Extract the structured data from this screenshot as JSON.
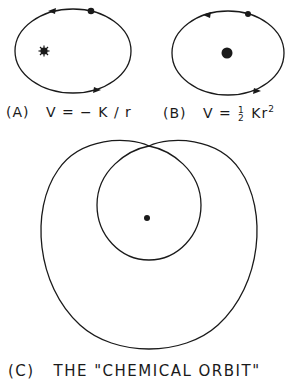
{
  "panels": {
    "a": {
      "tag": "(A)",
      "formula": "V = − K / r",
      "formula_prefix": "V = − K / r",
      "description": "Elliptical orbit in Coulomb (1/r) potential with force center at focus"
    },
    "b": {
      "tag": "(B)",
      "formula_prefix": "V =",
      "fraction_numerator": "1",
      "fraction_denominator": "2",
      "formula_suffix": "Kr",
      "exponent": "2",
      "description": "Elliptical orbit in harmonic potential with force center at center"
    },
    "c": {
      "tag": "(C)",
      "caption": "THE \"CHEMICAL ORBIT\"",
      "description": "Self-intersecting precessing orbit with inner and outer loops"
    }
  },
  "colors": {
    "ink": "#1a1a1a",
    "background": "#ffffff"
  }
}
